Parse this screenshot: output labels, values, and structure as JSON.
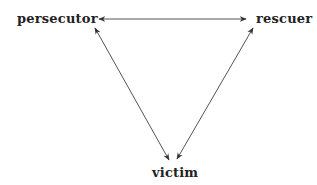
{
  "diagram": {
    "type": "triangle",
    "nodes": [
      {
        "id": "persecutor",
        "label": "persecutor"
      },
      {
        "id": "rescuer",
        "label": "rescuer"
      },
      {
        "id": "victim",
        "label": "victim"
      }
    ],
    "edges": [
      {
        "from": "persecutor",
        "to": "rescuer",
        "direction": "bidirectional"
      },
      {
        "from": "persecutor",
        "to": "victim",
        "direction": "bidirectional"
      },
      {
        "from": "rescuer",
        "to": "victim",
        "direction": "bidirectional"
      }
    ],
    "colors": {
      "line": "#444444",
      "text": "#222222",
      "background": "#ffffff"
    }
  }
}
